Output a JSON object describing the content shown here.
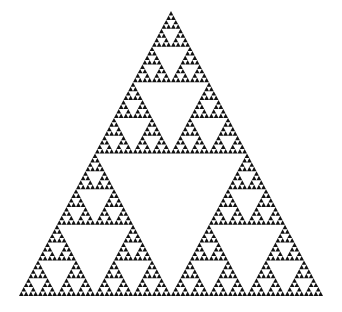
{
  "figure": {
    "name": "Sierpinski triangle fractal",
    "type": "sierpinski-triangle",
    "recursion_depth": 6,
    "fill_color": "#111111",
    "background_color": "#ffffff",
    "canvas": {
      "width": 342,
      "height": 312
    },
    "vertices": {
      "apex": [
        171,
        11
      ],
      "bottom_left": [
        19,
        296
      ],
      "bottom_right": [
        323,
        296
      ]
    }
  }
}
